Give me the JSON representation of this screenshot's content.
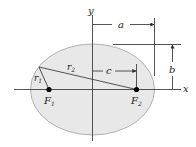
{
  "diagram": {
    "colors": {
      "ellipse_fill": "#e8e8e8",
      "ellipse_stroke": "#9a9a9a",
      "line": "#2a2a2a",
      "focus": "#000000"
    },
    "labels": {
      "y_axis": "y",
      "x_axis": "x",
      "a": "a",
      "b": "b",
      "c": "c",
      "r1": "r",
      "r1_sub": "1",
      "r2": "r",
      "r2_sub": "2",
      "F1": "F",
      "F1_sub": "1",
      "F2": "F",
      "F2_sub": "2"
    }
  }
}
